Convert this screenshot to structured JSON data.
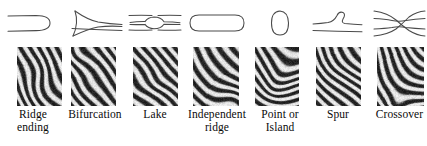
{
  "figure": {
    "background_color": "#ffffff",
    "stroke_color": "#4a4a4a",
    "text_color": "#0a0a0a",
    "columns": 7,
    "width": 427,
    "height": 146
  },
  "items": [
    {
      "index": 1,
      "label": "Ridge\nending",
      "label_line1": "Ridge",
      "label_line2": "ending",
      "schematic_name": "ridge-ending-diagram",
      "schematic_description": "Two parallel ridge lines joined by a rounded cap opening to the left",
      "patch_name": "ridge-ending-fingerprint-patch",
      "ridge_angle_deg": -58,
      "ridge_period_px": 8.5,
      "ridge_curvature": 0.05,
      "col_left": 6,
      "col_width": 54,
      "patch_left": 11,
      "patch_width": 45
    },
    {
      "index": 2,
      "label": "Bifurcation",
      "label_line1": "Bifurcation",
      "label_line2": "",
      "schematic_name": "bifurcation-diagram",
      "schematic_description": "A single ridge on the right splitting into two diverging ridges toward the left",
      "patch_name": "bifurcation-fingerprint-patch",
      "ridge_angle_deg": -55,
      "ridge_period_px": 8.0,
      "ridge_curvature": 0.12,
      "col_left": 66,
      "col_width": 58,
      "patch_left": 71,
      "patch_width": 45
    },
    {
      "index": 3,
      "label": "Lake",
      "label_line1": "Lake",
      "label_line2": "",
      "schematic_name": "lake-diagram",
      "schematic_description": "A ridge that splits into an enclosed oval and merges again, with short parallel ridges above and below",
      "patch_name": "lake-fingerprint-patch",
      "ridge_angle_deg": -48,
      "ridge_period_px": 9.0,
      "ridge_curvature": 0.1,
      "col_left": 128,
      "col_width": 54,
      "patch_left": 133,
      "patch_width": 45
    },
    {
      "index": 4,
      "label": "Independent\nridge",
      "label_line1": "Independent",
      "label_line2": "ridge",
      "schematic_name": "independent-ridge-diagram",
      "schematic_description": "A long isolated capsule shape with rounded ends",
      "patch_name": "independent-ridge-fingerprint-patch",
      "ridge_angle_deg": -44,
      "ridge_period_px": 9.5,
      "ridge_curvature": 0.16,
      "col_left": 186,
      "col_width": 62,
      "patch_left": 193,
      "patch_width": 46
    },
    {
      "index": 5,
      "label": "Point or\nIsland",
      "label_line1": "Point or",
      "label_line2": "Island",
      "schematic_name": "point-or-island-diagram",
      "schematic_description": "A small isolated oval ridge fragment",
      "patch_name": "point-or-island-fingerprint-patch",
      "ridge_angle_deg": -20,
      "ridge_period_px": 9.5,
      "ridge_curvature": 0.45,
      "col_left": 252,
      "col_width": 56,
      "patch_left": 255,
      "patch_width": 44
    },
    {
      "index": 6,
      "label": "Spur",
      "label_line1": "Spur",
      "label_line2": "",
      "schematic_name": "spur-diagram",
      "schematic_description": "A ridge with a short hooked branch rising from it, above a separate straight ridge",
      "patch_name": "spur-fingerprint-patch",
      "ridge_angle_deg": -50,
      "ridge_period_px": 8.0,
      "ridge_curvature": 0.08,
      "col_left": 312,
      "col_width": 52,
      "patch_left": 316,
      "patch_width": 45
    },
    {
      "index": 7,
      "label": "Crossover",
      "label_line1": "Crossover",
      "label_line2": "",
      "schematic_name": "crossover-diagram",
      "schematic_description": "Two ridges crossing in an X with a short bridge between them",
      "patch_name": "crossover-fingerprint-patch",
      "ridge_angle_deg": -35,
      "ridge_period_px": 8.5,
      "ridge_curvature": 0.5,
      "col_left": 372,
      "col_width": 54,
      "patch_left": 377,
      "patch_width": 47
    }
  ]
}
